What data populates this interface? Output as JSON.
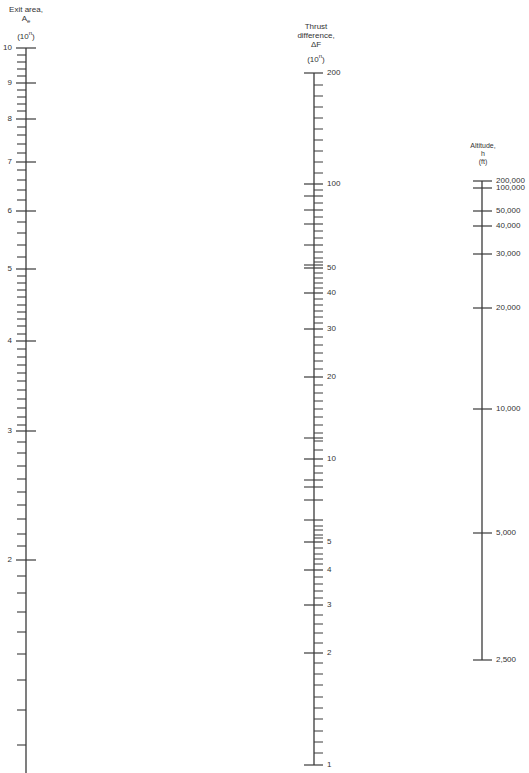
{
  "scales": [
    {
      "id": "exit-area",
      "title_lines": [
        "Exit area,",
        "A",
        "(10",
        ")"
      ],
      "title": {
        "line1": "Exit area,",
        "symbol": "A",
        "subscript": "e",
        "unit_prefix": "(10",
        "unit_exp": "n",
        "unit_suffix": ")"
      },
      "axis_x": 26,
      "y_top": 48,
      "y_bottom": 773,
      "tick_side": "left",
      "labels": [
        {
          "value": "10",
          "y": 48
        },
        {
          "value": "9",
          "y": 83
        },
        {
          "value": "8",
          "y": 119
        },
        {
          "value": "7",
          "y": 162
        },
        {
          "value": "6",
          "y": 211
        },
        {
          "value": "5",
          "y": 269
        },
        {
          "value": "4",
          "y": 341
        },
        {
          "value": "3",
          "y": 431
        },
        {
          "value": "2",
          "y": 560
        }
      ],
      "minor_ticks": [
        55,
        62,
        69,
        76,
        90,
        97,
        104,
        111,
        127,
        135,
        144,
        153,
        170,
        180,
        190,
        200,
        222,
        233,
        245,
        257,
        276,
        283,
        290,
        297,
        305,
        312,
        319,
        326,
        334,
        349,
        357,
        365,
        373,
        381,
        390,
        399,
        408,
        417,
        425,
        442,
        453,
        466,
        479,
        492,
        505,
        519,
        534,
        546,
        576,
        593,
        612,
        632,
        654,
        680,
        710,
        745
      ]
    },
    {
      "id": "thrust-difference",
      "title": {
        "line1": "Thrust",
        "line2": "difference,",
        "symbol": "ΔF",
        "unit_prefix": "(10",
        "unit_exp": "n",
        "unit_suffix": ")"
      },
      "axis_x": 314,
      "y_top": 73,
      "y_bottom": 765,
      "labels": [
        {
          "value": "200",
          "y": 73
        },
        {
          "value": "100",
          "y": 184
        },
        {
          "value": "50",
          "y": 268
        },
        {
          "value": "40",
          "y": 293
        },
        {
          "value": "30",
          "y": 329
        },
        {
          "value": "20",
          "y": 377
        },
        {
          "value": "10",
          "y": 459
        },
        {
          "value": "5",
          "y": 542
        },
        {
          "value": "4",
          "y": 570
        },
        {
          "value": "3",
          "y": 605
        },
        {
          "value": "2",
          "y": 653
        },
        {
          "value": "1",
          "y": 765
        }
      ],
      "unlabeled_major_ticks": [
        196,
        210,
        224,
        245,
        265,
        438,
        480,
        487,
        500,
        520
      ],
      "minor_ticks": [
        85,
        96,
        107,
        118,
        129,
        140,
        151,
        162,
        173,
        190,
        203,
        217,
        231,
        238,
        252,
        258,
        262,
        273,
        278,
        283,
        288,
        299,
        305,
        311,
        317,
        323,
        337,
        345,
        353,
        361,
        369,
        385,
        393,
        401,
        409,
        417,
        425,
        433,
        441,
        450,
        466,
        473,
        526,
        530,
        535,
        538,
        548,
        554,
        559,
        564,
        577,
        584,
        591,
        598,
        615,
        624,
        633,
        643,
        663,
        674,
        685,
        697,
        708,
        719,
        731,
        742,
        753
      ]
    },
    {
      "id": "altitude",
      "title": {
        "line1": "Altitude,",
        "symbol": "h",
        "unit": "(ft)"
      },
      "axis_x": 482,
      "y_top": 181,
      "y_bottom": 660,
      "labels": [
        {
          "value": "200,000",
          "y": 181
        },
        {
          "value": "100,000",
          "y": 188
        },
        {
          "value": "50,000",
          "y": 211
        },
        {
          "value": "40,000",
          "y": 226
        },
        {
          "value": "30,000",
          "y": 254
        },
        {
          "value": "20,000",
          "y": 308
        },
        {
          "value": "10,000",
          "y": 409
        },
        {
          "value": "5,000",
          "y": 533
        },
        {
          "value": "2,500",
          "y": 660
        }
      ],
      "minor_ticks": []
    }
  ],
  "style": {
    "line_color": "#3a3a3a",
    "text_color": "#333333"
  }
}
